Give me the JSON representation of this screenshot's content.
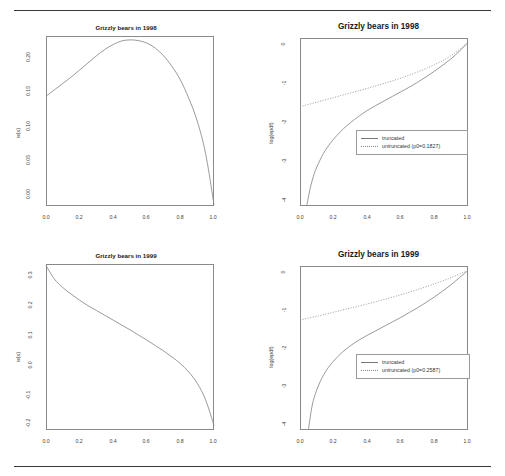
{
  "page": {
    "rules": {
      "top": true,
      "bottom": true
    },
    "background": "#ffffff",
    "line_color": "#888888",
    "frame_color": "#8a8a8a"
  },
  "panels": [
    {
      "id": "top-left",
      "title": "Grizzly bears in 1998",
      "title_style": "small",
      "xlabel": "",
      "ylabel": "w(x)",
      "xticks": [
        "0.0",
        "0.2",
        "0.4",
        "0.6",
        "0.8",
        "1.0"
      ],
      "yticks": [
        "0.00",
        "0.05",
        "0.10",
        "0.15",
        "0.20"
      ]
    },
    {
      "id": "top-right",
      "title": "Grizzly bears in 1998",
      "title_style": "big",
      "xlabel": "",
      "ylabel": "log(epdf)",
      "xticks": [
        "0.0",
        "0.2",
        "0.4",
        "0.6",
        "0.8",
        "1.0"
      ],
      "yticks": [
        "0",
        "-1",
        "-2",
        "-3",
        "-4"
      ],
      "legend": {
        "items": [
          {
            "label": "truncated",
            "style": "solid"
          },
          {
            "label": "untruncated (p0=0.1827)",
            "style": "dotted"
          }
        ]
      }
    },
    {
      "id": "bottom-left",
      "title": "Grizzly bears in 1999",
      "title_style": "small",
      "xlabel": "",
      "ylabel": "w(x)",
      "xticks": [
        "0.0",
        "0.2",
        "0.4",
        "0.6",
        "0.8",
        "1.0"
      ],
      "yticks": [
        "0.3",
        "0.2",
        "0.1",
        "0.0",
        "-0.1",
        "-0.2"
      ]
    },
    {
      "id": "bottom-right",
      "title": "Grizzly bears in 1999",
      "title_style": "big",
      "xlabel": "",
      "ylabel": "log(epdf)",
      "xticks": [
        "0.0",
        "0.2",
        "0.4",
        "0.6",
        "0.8",
        "1.0"
      ],
      "yticks": [
        "0",
        "-1",
        "-2",
        "-3",
        "-4"
      ],
      "legend": {
        "items": [
          {
            "label": "truncated",
            "style": "solid"
          },
          {
            "label": "untruncated (p0=0.2587)",
            "style": "dotted"
          }
        ]
      }
    }
  ],
  "chart_data": [
    {
      "id": "top-left",
      "type": "line",
      "title": "Grizzly bears in 1998",
      "xlabel": "",
      "ylabel": "w(x)",
      "xlim": [
        0.0,
        1.0
      ],
      "ylim": [
        -0.012,
        0.228
      ],
      "grid": false,
      "legend": null,
      "series": [
        {
          "name": "w(x)",
          "style": "solid",
          "x": [
            0.0,
            0.05,
            0.1,
            0.15,
            0.2,
            0.25,
            0.3,
            0.35,
            0.4,
            0.45,
            0.5,
            0.55,
            0.6,
            0.65,
            0.7,
            0.75,
            0.8,
            0.85,
            0.9,
            0.95,
            1.0
          ],
          "values": [
            0.143,
            0.152,
            0.161,
            0.17,
            0.18,
            0.19,
            0.2,
            0.209,
            0.216,
            0.221,
            0.2225,
            0.2215,
            0.218,
            0.211,
            0.2,
            0.185,
            0.166,
            0.14,
            0.108,
            0.062,
            -0.01
          ]
        }
      ]
    },
    {
      "id": "top-right",
      "type": "line",
      "title": "Grizzly bears in 1998",
      "xlabel": "",
      "ylabel": "log(epdf)",
      "xlim": [
        0.0,
        1.0
      ],
      "ylim": [
        -4.3,
        0.1
      ],
      "grid": false,
      "legend_position": "lower-right",
      "series": [
        {
          "name": "truncated",
          "style": "solid",
          "x": [
            0.04,
            0.06,
            0.08,
            0.1,
            0.14,
            0.18,
            0.22,
            0.26,
            0.3,
            0.35,
            0.4,
            0.45,
            0.5,
            0.55,
            0.6,
            0.65,
            0.7,
            0.75,
            0.8,
            0.85,
            0.9,
            0.95,
            1.0
          ],
          "values": [
            -4.3,
            -3.85,
            -3.52,
            -3.28,
            -2.92,
            -2.66,
            -2.45,
            -2.27,
            -2.12,
            -1.95,
            -1.8,
            -1.67,
            -1.55,
            -1.43,
            -1.31,
            -1.19,
            -1.06,
            -0.92,
            -0.77,
            -0.61,
            -0.44,
            -0.24,
            -0.02
          ]
        },
        {
          "name": "untruncated (p0=0.1827)",
          "style": "dotted",
          "x": [
            0.0,
            0.1,
            0.2,
            0.3,
            0.4,
            0.5,
            0.6,
            0.7,
            0.8,
            0.9,
            1.0
          ],
          "values": [
            -1.7,
            -1.58,
            -1.46,
            -1.34,
            -1.22,
            -1.09,
            -0.95,
            -0.79,
            -0.6,
            -0.36,
            -0.02
          ]
        }
      ]
    },
    {
      "id": "bottom-left",
      "type": "line",
      "title": "Grizzly bears in 1999",
      "xlabel": "",
      "ylabel": "w(x)",
      "xlim": [
        0.0,
        1.0
      ],
      "ylim": [
        -0.2,
        0.35
      ],
      "grid": false,
      "legend": null,
      "series": [
        {
          "name": "w(x)",
          "style": "solid",
          "x": [
            0.0,
            0.05,
            0.1,
            0.15,
            0.2,
            0.25,
            0.3,
            0.35,
            0.4,
            0.45,
            0.5,
            0.55,
            0.6,
            0.65,
            0.7,
            0.75,
            0.8,
            0.85,
            0.9,
            0.95,
            1.0
          ],
          "values": [
            0.345,
            0.3,
            0.272,
            0.25,
            0.23,
            0.212,
            0.196,
            0.18,
            0.164,
            0.148,
            0.132,
            0.115,
            0.098,
            0.08,
            0.062,
            0.042,
            0.02,
            -0.008,
            -0.045,
            -0.1,
            -0.185
          ]
        }
      ]
    },
    {
      "id": "bottom-right",
      "type": "line",
      "title": "Grizzly bears in 1999",
      "xlabel": "",
      "ylabel": "log(epdf)",
      "xlim": [
        0.0,
        1.0
      ],
      "ylim": [
        -4.3,
        0.1
      ],
      "grid": false,
      "legend_position": "lower-right",
      "series": [
        {
          "name": "truncated",
          "style": "solid",
          "x": [
            0.05,
            0.07,
            0.09,
            0.12,
            0.16,
            0.2,
            0.25,
            0.3,
            0.35,
            0.4,
            0.45,
            0.5,
            0.55,
            0.6,
            0.65,
            0.7,
            0.75,
            0.8,
            0.85,
            0.9,
            0.95,
            1.0
          ],
          "values": [
            -4.3,
            -3.7,
            -3.35,
            -3.0,
            -2.68,
            -2.45,
            -2.22,
            -2.04,
            -1.89,
            -1.76,
            -1.64,
            -1.52,
            -1.4,
            -1.28,
            -1.15,
            -1.02,
            -0.88,
            -0.73,
            -0.57,
            -0.4,
            -0.21,
            -0.02
          ]
        },
        {
          "name": "untruncated (p0=0.2587)",
          "style": "dotted",
          "x": [
            0.0,
            0.1,
            0.2,
            0.3,
            0.4,
            0.5,
            0.6,
            0.7,
            0.8,
            0.9,
            1.0
          ],
          "values": [
            -1.35,
            -1.25,
            -1.14,
            -1.03,
            -0.92,
            -0.8,
            -0.67,
            -0.53,
            -0.38,
            -0.21,
            -0.02
          ]
        }
      ]
    }
  ]
}
